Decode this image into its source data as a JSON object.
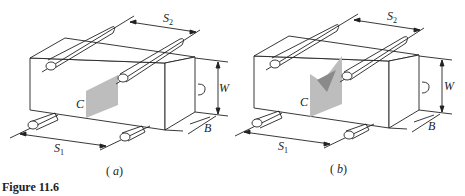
{
  "figure": {
    "caption": "Figure 11.6",
    "colors": {
      "line": "#222222",
      "crack_fill": "#bdbdbd",
      "crack_dark": "#8a8a8a"
    }
  },
  "panels": [
    {
      "id": "a",
      "subcaption_open": "(",
      "subcaption_letter": "a",
      "subcaption_close": ")",
      "description": "Beam specimen with flat crack plane",
      "labels": {
        "S2": "S",
        "S2_sub": "2",
        "S1": "S",
        "S1_sub": "1",
        "W": "W",
        "B": "B",
        "C": "C"
      }
    },
    {
      "id": "b",
      "subcaption_open": "(",
      "subcaption_letter": "b",
      "subcaption_close": ")",
      "description": "Beam specimen with chevron notch crack plane",
      "labels": {
        "S2": "S",
        "S2_sub": "2",
        "S1": "S",
        "S1_sub": "1",
        "W": "W",
        "B": "B",
        "C": "C"
      }
    }
  ]
}
